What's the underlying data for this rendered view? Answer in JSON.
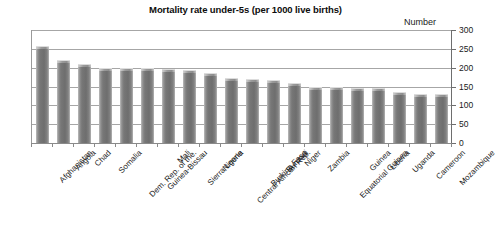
{
  "chart_data": {
    "type": "bar",
    "title": "Mortality rate under-5s (per 1000 live births)",
    "xlabel": "",
    "ylabel": "Number",
    "ylim": [
      0,
      300
    ],
    "ytick_step": 50,
    "yticks": [
      300,
      250,
      200,
      150,
      100,
      50,
      0
    ],
    "ytick_labels": [
      "300",
      "250",
      "200",
      "150",
      "100",
      "50",
      "0"
    ],
    "y_axis_position": "right",
    "grid": true,
    "grid_axis": "y",
    "legend": false,
    "bar_color": "#757575",
    "categories": [
      "Afghanistan",
      "Angola",
      "Chad",
      "Somalia",
      "Dem. Rep. of the.",
      "Guinea-Bissau",
      "Mali",
      "Sierra Leone",
      "Nigeria",
      "Central African Rep.",
      "Burkina Faso",
      "Burundi",
      "Niger",
      "Zambia",
      "Equatorial Guinea",
      "Guinea",
      "Liberia",
      "Uganda",
      "Cameroon",
      "Mozambique"
    ],
    "values": [
      257,
      220,
      209,
      200,
      199,
      198,
      196,
      194,
      186,
      173,
      169,
      168,
      160,
      148,
      148,
      146,
      145,
      135,
      131,
      130
    ]
  }
}
